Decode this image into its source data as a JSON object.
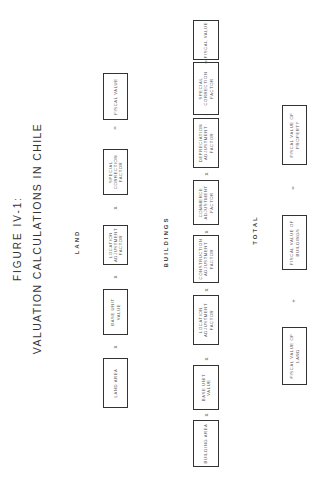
{
  "title": {
    "line1": "FIGURE IV-1:",
    "line2": "VALUATION CALCULATIONS IN CHILE"
  },
  "orientation": "page rotated 90° counter-clockwise",
  "land": {
    "heading": "LAND",
    "boxes": [
      {
        "label": "LAND AREA"
      },
      {
        "label": "BASE UNIT VALUE"
      },
      {
        "label": "LOCATION ADJUSTMENT FACTOR"
      },
      {
        "label": "SPECIAL CORRECTION FACTOR"
      },
      {
        "label": "FISCAL VALUE"
      }
    ],
    "operators": [
      "x",
      "x",
      "x",
      "="
    ]
  },
  "buildings": {
    "heading": "BUILDINGS",
    "boxes": [
      {
        "label": "BUILDING AREA"
      },
      {
        "label": "BASE UNIT VALUE"
      },
      {
        "label": "LOCATION ADJUSTMENT FACTOR"
      },
      {
        "label": "CONSTRUCTION ADJUSTMENT FACTOR"
      },
      {
        "label": "COMMERCE ADJUSTMENT FACTOR"
      },
      {
        "label": "DEPRECIATION ADJUSTMENT FACTOR"
      },
      {
        "label": "SPECIAL CORRECTION FACTOR"
      },
      {
        "label": "FISCAL VALUE"
      }
    ],
    "operators": [
      "x",
      "x",
      "x",
      "x",
      "x",
      "x",
      "="
    ]
  },
  "total": {
    "heading": "TOTAL",
    "boxes": [
      {
        "label": "FISCAL VALUE OF LAND"
      },
      {
        "label": "FISCAL VALUE OF BUILDINGS"
      },
      {
        "label": "FISCAL VALUE OF PROPERTY"
      }
    ],
    "operators": [
      "+",
      "="
    ]
  }
}
